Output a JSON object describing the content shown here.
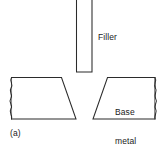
{
  "figure": {
    "caption": "(a)",
    "stroke_color": "#2b2b2b",
    "background_color": "#ffffff",
    "labels": {
      "filler": "Filler",
      "base_metal_line1": "Base",
      "base_metal_line2": "metal"
    },
    "parts": {
      "filler_rod": "filler-rod",
      "left_workpiece": "left-base-metal-workpiece",
      "right_workpiece": "right-base-metal-workpiece",
      "left_break_line": "left-break-line",
      "right_break_line": "right-break-line",
      "joint_gap": "joint-gap"
    }
  }
}
